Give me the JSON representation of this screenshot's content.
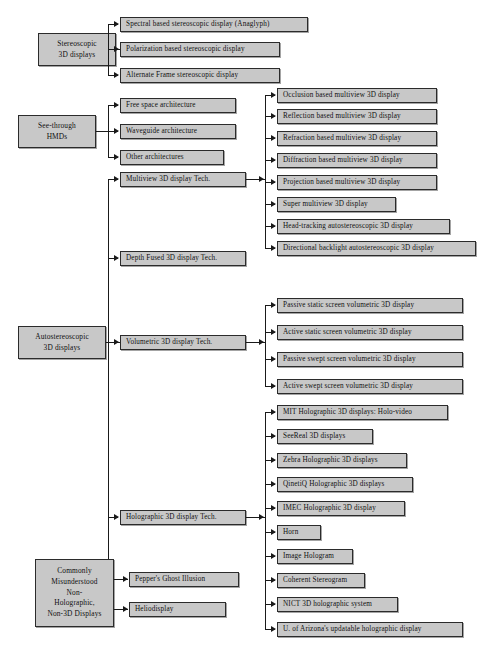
{
  "diagram": {
    "background_color": "#ffffff",
    "node_fill_color": "#c8c8c8",
    "node_border_color": "#2b2b2b",
    "connector_color": "#1a1a1a",
    "roots": [
      {
        "id": "stereoscopic",
        "label": "Stereoscopic\n3D displays",
        "label_line1": "Stereoscopic",
        "label_line2": "3D displays",
        "children": [
          "Spectral based stereoscopic display (Anaglyph)",
          "Polarization based stereoscopic display",
          "Alternate Frame stereoscopic display"
        ]
      },
      {
        "id": "see-through-hmds",
        "label": "See-through\nHMDs",
        "label_line1": "See-through",
        "label_line2": "HMDs",
        "children": [
          "Free space architecture",
          "Waveguide architecture",
          "Other architectures"
        ]
      },
      {
        "id": "autostereoscopic",
        "label": "Autostereoscopic\n3D displays",
        "label_line1": "Autostereoscopic",
        "label_line2": "3D displays",
        "children": [
          "Multiview 3D display Tech.",
          "Depth Fused 3D display Tech.",
          "Volumetric 3D display Tech.",
          "Holographic 3D display Tech."
        ]
      },
      {
        "id": "commonly-misunderstood",
        "label": "Commonly Misunderstood Non-Holographic, Non-3D Displays",
        "label_line1": "Commonly",
        "label_line2": "Misunderstood",
        "label_line3": "Non-",
        "label_line4": "Holographic,",
        "label_line5": "Non-3D Displays",
        "children": [
          "Pepper's Ghost Illusion",
          "Heliodisplay"
        ]
      }
    ],
    "branches": {
      "multiview": {
        "parent_label": "Multiview 3D display Tech.",
        "leaves": [
          "Occlusion based multiview 3D display",
          "Reflection based multiview 3D display",
          "Refraction based multiview 3D display",
          "Diffraction based multiview 3D display",
          "Projection based multiview 3D display",
          "Super multiview 3D display",
          "Head-tracking autostereoscopic 3D display",
          "Directional backlight autostereoscopic 3D display"
        ]
      },
      "depth_fused": {
        "parent_label": "Depth Fused 3D display Tech.",
        "leaves": []
      },
      "volumetric": {
        "parent_label": "Volumetric 3D display Tech.",
        "leaves": [
          "Passive static screen volumetric 3D display",
          "Active static screen volumetric 3D display",
          "Passive swept screen volumetric 3D display",
          "Active swept screen volumetric 3D display"
        ]
      },
      "holographic": {
        "parent_label": "Holographic 3D display Tech.",
        "leaves": [
          "MIT Holographic 3D displays: Holo-video",
          "SeeReal 3D displays",
          "Zebra Holographic 3D displays",
          "QinetiQ Holographic 3D displays",
          "IMEC Holographic 3D display",
          "Horn",
          "Image Hologram",
          "Coherent Stereogram",
          "NICT 3D holographic system",
          "U. of Arizona's updatable holographic display"
        ]
      }
    }
  }
}
